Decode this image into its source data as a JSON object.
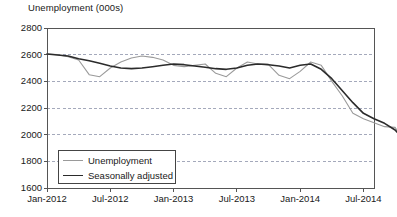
{
  "chart_data": {
    "type": "line",
    "title": "Unemployment (000s)",
    "xlabel": "",
    "ylabel": "",
    "ylim": [
      1600,
      2800
    ],
    "yticks": [
      1600,
      1800,
      2000,
      2200,
      2400,
      2600,
      2800
    ],
    "grid": true,
    "grid_style": "dashed-horizontal",
    "legend_position": "bottom-left-inside",
    "x_tick_labels": [
      "Jan-2012",
      "Jul-2012",
      "Jan-2013",
      "Jul-2013",
      "Jan-2014",
      "Jul-2014"
    ],
    "x_tick_months": [
      0,
      6,
      12,
      18,
      24,
      30
    ],
    "x_range_months": [
      0,
      31
    ],
    "x": [
      "Jan-2012",
      "Feb-2012",
      "Mar-2012",
      "Apr-2012",
      "May-2012",
      "Jun-2012",
      "Jul-2012",
      "Aug-2012",
      "Sep-2012",
      "Oct-2012",
      "Nov-2012",
      "Dec-2012",
      "Jan-2013",
      "Feb-2013",
      "Mar-2013",
      "Apr-2013",
      "May-2013",
      "Jun-2013",
      "Jul-2013",
      "Aug-2013",
      "Sep-2013",
      "Oct-2013",
      "Nov-2013",
      "Dec-2013",
      "Jan-2014",
      "Feb-2014",
      "Mar-2014",
      "Apr-2014",
      "May-2014",
      "Jun-2014",
      "Jul-2014",
      "Aug-2014",
      "Sep-2014",
      "Oct-2014",
      "Nov-2014",
      "Dec-2014"
    ],
    "series": [
      {
        "name": "Unemployment",
        "color": "#9a9a9a",
        "width": 1.1,
        "values": [
          2605,
          2600,
          2585,
          2560,
          2450,
          2435,
          2500,
          2545,
          2575,
          2590,
          2580,
          2560,
          2520,
          2510,
          2520,
          2530,
          2460,
          2435,
          2500,
          2545,
          2530,
          2525,
          2445,
          2420,
          2475,
          2545,
          2520,
          2400,
          2290,
          2160,
          2120,
          2090,
          2060,
          2055,
          1935,
          1800
        ]
      },
      {
        "name": "Seasonally adjusted",
        "color": "#2b2b2b",
        "width": 1.6,
        "values": [
          2605,
          2598,
          2590,
          2570,
          2555,
          2535,
          2515,
          2500,
          2495,
          2500,
          2510,
          2520,
          2530,
          2525,
          2515,
          2505,
          2495,
          2490,
          2500,
          2520,
          2530,
          2525,
          2515,
          2500,
          2520,
          2530,
          2490,
          2420,
          2330,
          2240,
          2160,
          2120,
          2085,
          2035,
          1950,
          1840
        ]
      }
    ]
  },
  "legend": {
    "items": [
      {
        "label": "Unemployment"
      },
      {
        "label": "Seasonally adjusted"
      }
    ]
  },
  "axes": {
    "frame_color": "#555555",
    "grid_color": "#9aa0b4"
  }
}
